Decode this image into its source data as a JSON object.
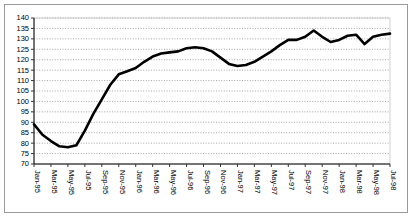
{
  "chart_data": {
    "type": "line",
    "title": "",
    "subtitle": "",
    "xlabel": "",
    "ylabel": "",
    "ylim": [
      70,
      140
    ],
    "ytick_step": 5,
    "yticks": [
      70,
      75,
      80,
      85,
      90,
      95,
      100,
      105,
      110,
      115,
      120,
      125,
      130,
      135,
      140
    ],
    "grid": true,
    "grid_axis": "y",
    "grid_style": "dotted",
    "legend": false,
    "legend_position": "none",
    "line_color": "#000000",
    "background_color": "#ffffff",
    "frame_color": "#9a9a9a",
    "xtick_labels": [
      "Jan-95",
      "Mar-95",
      "May-95",
      "Jul-95",
      "Sep-95",
      "Nov-95",
      "Jan-96",
      "Mar-96",
      "May-96",
      "Jul-96",
      "Sep-96",
      "Nov-96",
      "Jan-97",
      "Mar-97",
      "May-97",
      "Jul-97",
      "Sep-97",
      "Nov-97",
      "Jan-98",
      "Mar-98",
      "May-98",
      "Jul-98"
    ],
    "xtick_label_rotation": 90,
    "x": [
      "Jan-95",
      "Feb-95",
      "Mar-95",
      "Apr-95",
      "May-95",
      "Jun-95",
      "Jul-95",
      "Aug-95",
      "Sep-95",
      "Oct-95",
      "Nov-95",
      "Dec-95",
      "Jan-96",
      "Feb-96",
      "Mar-96",
      "Apr-96",
      "May-96",
      "Jun-96",
      "Jul-96",
      "Aug-96",
      "Sep-96",
      "Oct-96",
      "Nov-96",
      "Dec-96",
      "Jan-97",
      "Feb-97",
      "Mar-97",
      "Apr-97",
      "May-97",
      "Jun-97",
      "Jul-97",
      "Aug-97",
      "Sep-97",
      "Oct-97",
      "Nov-97",
      "Dec-97",
      "Jan-98",
      "Feb-98",
      "Mar-98",
      "Apr-98",
      "May-98",
      "Jun-98",
      "Jul-98"
    ],
    "values": [
      89,
      84,
      81,
      78.5,
      78,
      79,
      86,
      94,
      101,
      108,
      113,
      114.5,
      116,
      119,
      121.5,
      123,
      123.5,
      124,
      125.5,
      126,
      125.5,
      124,
      121,
      118,
      117,
      117.5,
      119,
      121.5,
      124,
      127,
      129.5,
      129.5,
      131,
      134,
      131,
      128.5,
      129.5,
      131.5,
      132,
      127.5,
      131,
      132,
      132.5
    ],
    "annotations": []
  }
}
